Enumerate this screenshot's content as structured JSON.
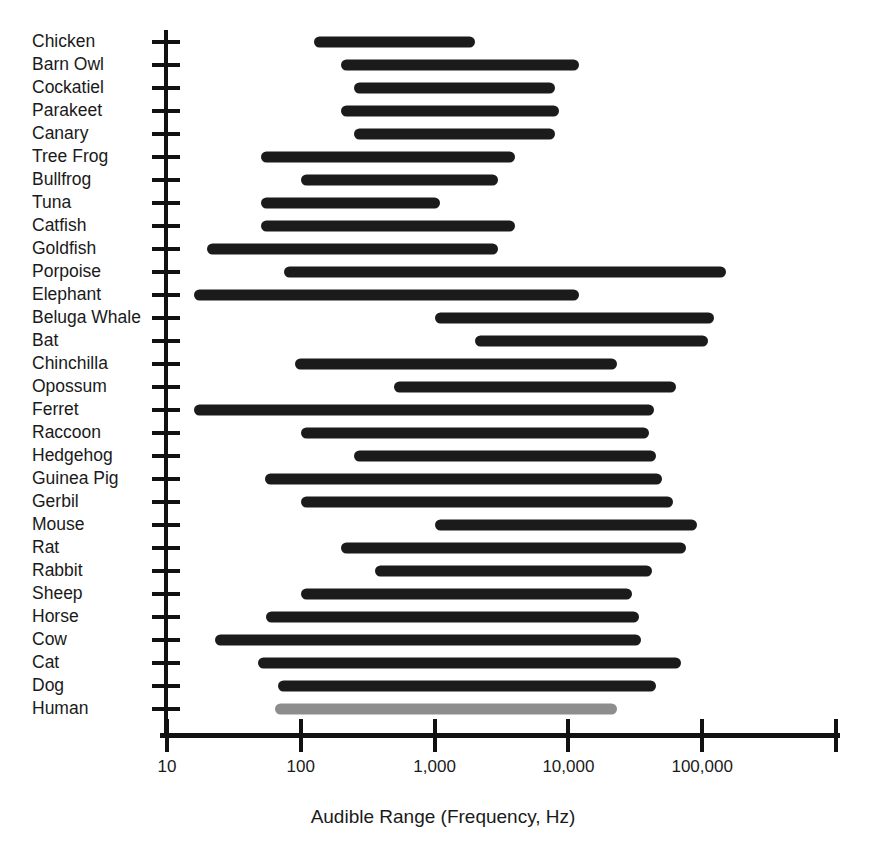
{
  "chart_data": {
    "type": "bar",
    "orientation": "horizontal",
    "subtype": "range-bar",
    "title": "",
    "xlabel": "Audible Range (Frequency, Hz)",
    "ylabel": "",
    "xscale": "log",
    "xlim": [
      10,
      1000000
    ],
    "grid": false,
    "legend": false,
    "xticks": [
      10,
      100,
      1000,
      10000,
      100000,
      1000000
    ],
    "xtick_labels": [
      "10",
      "100",
      "1,000",
      "10,000",
      "100,000",
      ""
    ],
    "categories": [
      "Chicken",
      "Barn Owl",
      "Cockatiel",
      "Parakeet",
      "Canary",
      "Tree Frog",
      "Bullfrog",
      "Tuna",
      "Catfish",
      "Goldfish",
      "Porpoise",
      "Elephant",
      "Beluga Whale",
      "Bat",
      "Chinchilla",
      "Opossum",
      "Ferret",
      "Raccoon",
      "Hedgehog",
      "Guinea Pig",
      "Gerbil",
      "Mouse",
      "Rat",
      "Rabbit",
      "Sheep",
      "Horse",
      "Cow",
      "Cat",
      "Dog",
      "Human"
    ],
    "series": [
      {
        "name": "Audible range",
        "ranges": [
          {
            "label": "Chicken",
            "low": 125,
            "high": 2000,
            "color": "#1b1b1b"
          },
          {
            "label": "Barn Owl",
            "low": 200,
            "high": 12000,
            "color": "#1b1b1b"
          },
          {
            "label": "Cockatiel",
            "low": 250,
            "high": 8000,
            "color": "#1b1b1b"
          },
          {
            "label": "Parakeet",
            "low": 200,
            "high": 8500,
            "color": "#1b1b1b"
          },
          {
            "label": "Canary",
            "low": 250,
            "high": 8000,
            "color": "#1b1b1b"
          },
          {
            "label": "Tree Frog",
            "low": 50,
            "high": 4000,
            "color": "#1b1b1b"
          },
          {
            "label": "Bullfrog",
            "low": 100,
            "high": 3000,
            "color": "#1b1b1b"
          },
          {
            "label": "Tuna",
            "low": 50,
            "high": 1100,
            "color": "#1b1b1b"
          },
          {
            "label": "Catfish",
            "low": 50,
            "high": 4000,
            "color": "#1b1b1b"
          },
          {
            "label": "Goldfish",
            "low": 20,
            "high": 3000,
            "color": "#1b1b1b"
          },
          {
            "label": "Porpoise",
            "low": 75,
            "high": 150000,
            "color": "#1b1b1b"
          },
          {
            "label": "Elephant",
            "low": 16,
            "high": 12000,
            "color": "#1b1b1b"
          },
          {
            "label": "Beluga Whale",
            "low": 1000,
            "high": 123000,
            "color": "#1b1b1b"
          },
          {
            "label": "Bat",
            "low": 2000,
            "high": 110000,
            "color": "#1b1b1b"
          },
          {
            "label": "Chinchilla",
            "low": 90,
            "high": 23000,
            "color": "#1b1b1b"
          },
          {
            "label": "Opossum",
            "low": 500,
            "high": 64000,
            "color": "#1b1b1b"
          },
          {
            "label": "Ferret",
            "low": 16,
            "high": 44000,
            "color": "#1b1b1b"
          },
          {
            "label": "Raccoon",
            "low": 100,
            "high": 40000,
            "color": "#1b1b1b"
          },
          {
            "label": "Hedgehog",
            "low": 250,
            "high": 45000,
            "color": "#1b1b1b"
          },
          {
            "label": "Guinea Pig",
            "low": 54,
            "high": 50000,
            "color": "#1b1b1b"
          },
          {
            "label": "Gerbil",
            "low": 100,
            "high": 60000,
            "color": "#1b1b1b"
          },
          {
            "label": "Mouse",
            "low": 1000,
            "high": 91000,
            "color": "#1b1b1b"
          },
          {
            "label": "Rat",
            "low": 200,
            "high": 76000,
            "color": "#1b1b1b"
          },
          {
            "label": "Rabbit",
            "low": 360,
            "high": 42000,
            "color": "#1b1b1b"
          },
          {
            "label": "Sheep",
            "low": 100,
            "high": 30000,
            "color": "#1b1b1b"
          },
          {
            "label": "Horse",
            "low": 55,
            "high": 33500,
            "color": "#1b1b1b"
          },
          {
            "label": "Cow",
            "low": 23,
            "high": 35000,
            "color": "#1b1b1b"
          },
          {
            "label": "Cat",
            "low": 48,
            "high": 70000,
            "color": "#1b1b1b"
          },
          {
            "label": "Dog",
            "low": 67,
            "high": 45000,
            "color": "#1b1b1b"
          },
          {
            "label": "Human",
            "low": 64,
            "high": 23000,
            "color": "#8d8d8d"
          }
        ]
      }
    ]
  },
  "axis": {
    "x_title": "Audible Range (Frequency, Hz)"
  },
  "colors": {
    "bar": "#1b1b1b",
    "human_bar": "#8d8d8d",
    "axis": "#111111",
    "text": "#1a1a1a",
    "background": "#ffffff"
  }
}
